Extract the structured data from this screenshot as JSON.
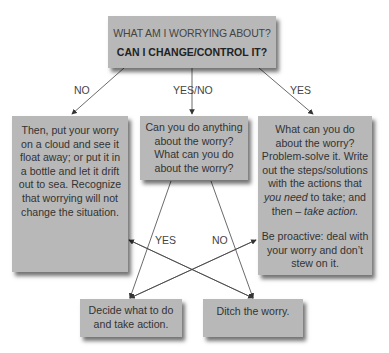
{
  "top_box": {
    "line1": "WHAT AM I WORRYING ABOUT?",
    "line2": "CAN I CHANGE/CONTROL IT?"
  },
  "branch_labels": {
    "no": "NO",
    "yes_no": "YES/NO",
    "yes": "YES",
    "cross_yes": "YES",
    "cross_no": "NO"
  },
  "left_box": {
    "text": "Then, put your worry on a cloud and see it float away; or put it in a bottle and let it drift out to sea. Recognize that worrying will not change the situation."
  },
  "middle_box": {
    "text": "Can you do anything about the worry? What can you do about the worry?"
  },
  "right_box": {
    "p1_a": "What can you do about the worry? Problem-solve it. Write out the steps/solutions with the actions that ",
    "p1_em1": "you need",
    "p1_b": " to take; and then – ",
    "p1_em2": "take action.",
    "p2": "Be proactive: deal with your worry and don’t stew on it."
  },
  "bottom_left_box": {
    "text": "Decide what to do and take action."
  },
  "bottom_right_box": {
    "text": "Ditch the worry."
  },
  "colors": {
    "box_fill": "#b8b8b8",
    "text": "#333333",
    "arrow": "#333333"
  }
}
